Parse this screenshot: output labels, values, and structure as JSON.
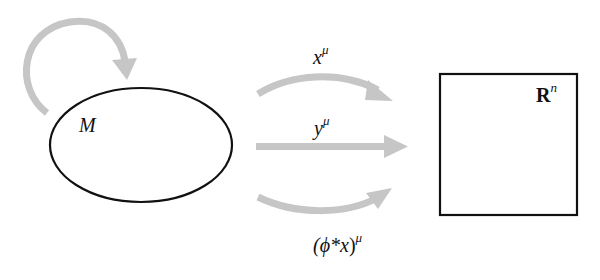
{
  "diagram": {
    "manifold": {
      "label": "M",
      "shape": "ellipse",
      "self_map_arrow": "phi-self-map"
    },
    "target_space": {
      "label_base": "R",
      "label_sup": "n",
      "shape": "square"
    },
    "maps": [
      {
        "id": "x",
        "label_base": "x",
        "label_sup": "μ",
        "style": "curved-up"
      },
      {
        "id": "y",
        "label_base": "y",
        "label_sup": "μ",
        "style": "straight"
      },
      {
        "id": "pullback",
        "label_prefix": "(ϕ*",
        "label_base": "x",
        "label_suffix": ")",
        "label_sup": "μ",
        "style": "curved-down"
      }
    ],
    "colors": {
      "arrow": "#c6c6c6",
      "outline": "#111111"
    }
  }
}
